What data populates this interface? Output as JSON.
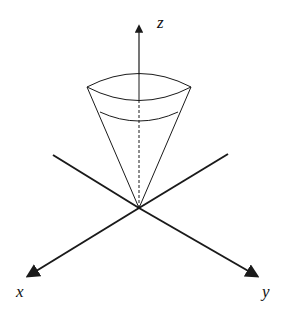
{
  "diagram": {
    "type": "3d-axes-with-cone",
    "axes": {
      "z_label": "z",
      "x_label": "x",
      "y_label": "y"
    },
    "colors": {
      "stroke": "#1a1a1a",
      "background": "#ffffff"
    }
  }
}
